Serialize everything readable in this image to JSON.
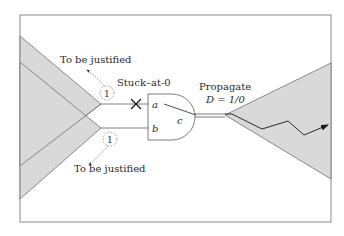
{
  "diagram": {
    "type": "fault-propagation-circuit",
    "colors": {
      "frame": "#8a8a8a",
      "cone_fill": "#d9d9d9",
      "cone_stroke": "#6e6e6e",
      "wire": "#6e6e6e",
      "text": "#2a2a2a",
      "path": "#3a3a3a"
    },
    "labels": {
      "justify_top": "To be justified",
      "justify_bottom": "To be justified",
      "stuck_at": "Stuck–at-0",
      "propagate": "Propagate",
      "d_value": "D = 1/0"
    },
    "gate": {
      "type": "AND",
      "input_a": "a",
      "input_b": "b",
      "output_c": "c"
    },
    "required_values": {
      "input_a_value": "1",
      "input_b_value": "1"
    },
    "fault_marker": "×"
  }
}
